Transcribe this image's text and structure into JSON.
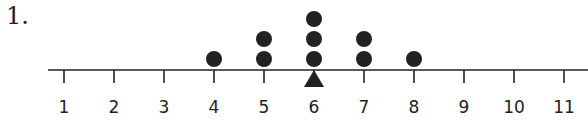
{
  "problem_number": "1.",
  "chart_data": {
    "type": "scatter",
    "subtype": "dot_plot",
    "title": "",
    "xlabel": "",
    "ylabel": "",
    "categories": [
      1,
      2,
      3,
      4,
      5,
      6,
      7,
      8,
      9,
      10,
      11
    ],
    "counts": [
      0,
      0,
      0,
      1,
      2,
      3,
      2,
      1,
      0,
      0,
      0
    ],
    "x": [
      4,
      5,
      5,
      6,
      6,
      6,
      7,
      7,
      8
    ],
    "xlim": [
      1,
      11
    ],
    "tick_labels": [
      "1",
      "2",
      "3",
      "4",
      "5",
      "6",
      "7",
      "8",
      "9",
      "10",
      "11"
    ],
    "annotations": [
      {
        "type": "triangle",
        "position": 6,
        "meaning": "balance point"
      }
    ],
    "grid": false
  },
  "style": {
    "ink": "#222222"
  }
}
